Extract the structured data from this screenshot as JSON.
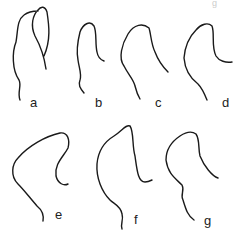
{
  "header_fragment": "g",
  "figures": [
    {
      "label": "a"
    },
    {
      "label": "b"
    },
    {
      "label": "c"
    },
    {
      "label": "d"
    },
    {
      "label": "e"
    },
    {
      "label": "f"
    },
    {
      "label": "g"
    }
  ],
  "colors": {
    "stroke": "#1a1a1a",
    "background": "#ffffff"
  }
}
